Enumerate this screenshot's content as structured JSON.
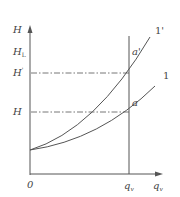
{
  "diagram": {
    "type": "pump characteristic H-q curve",
    "axes": {
      "y_label": "H",
      "x_label": "q",
      "x_label_sub": "v",
      "origin": "0"
    },
    "y_levels": [
      {
        "main": "H",
        "sub": "L",
        "note": "tick label"
      },
      {
        "main": "H",
        "prime": "'",
        "note": "dash-dot level for curve 1'"
      },
      {
        "main": "H",
        "note": "dash-dot level for curve 1"
      }
    ],
    "x_marker": {
      "main": "q",
      "sub": "v"
    },
    "curves": [
      {
        "id": "1'",
        "label": "1'",
        "point": "a'"
      },
      {
        "id": "1",
        "label": "1",
        "point": "a"
      }
    ],
    "colors": {
      "line": "#555555",
      "text": "#444444",
      "background": "#ffffff"
    }
  }
}
